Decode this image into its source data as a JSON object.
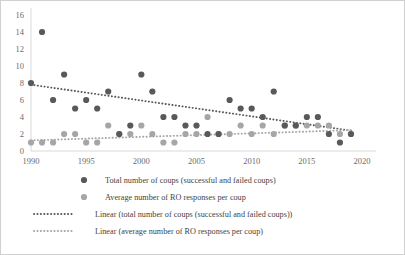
{
  "chart_data": {
    "type": "scatter",
    "title": "",
    "xlabel": "",
    "ylabel": "",
    "xlim": [
      1990,
      2020
    ],
    "ylim": [
      0,
      16
    ],
    "xticks": [
      "1990",
      "1995",
      "2000",
      "2005",
      "2010",
      "2015",
      "2020"
    ],
    "yticks": [
      "0",
      "2",
      "4",
      "6",
      "8",
      "10",
      "12",
      "14",
      "16"
    ],
    "grid": false,
    "legend_position": "bottom",
    "colors": {
      "total_coups": "#595959",
      "ro_responses": "#a6a6a6",
      "trend_total": "#595959",
      "trend_ro": "#a6a6a6",
      "axis": "#d9d9d9",
      "border": "#d0d0d0",
      "text": "#595959"
    },
    "series": [
      {
        "name": "Total number of coups (successful and failed coups)",
        "marker": "circle",
        "color": "#595959",
        "x": [
          1990,
          1991,
          1992,
          1993,
          1994,
          1995,
          1996,
          1997,
          1998,
          1999,
          2000,
          2001,
          2002,
          2003,
          2004,
          2005,
          2006,
          2007,
          2008,
          2009,
          2010,
          2011,
          2012,
          2013,
          2014,
          2015,
          2016,
          2017,
          2018,
          2019
        ],
        "y": [
          8,
          14,
          6,
          9,
          5,
          6,
          5,
          7,
          2,
          3,
          9,
          7,
          4,
          4,
          3,
          3,
          2,
          2,
          6,
          5,
          5,
          4,
          7,
          3,
          3,
          4,
          4,
          2,
          1,
          2
        ]
      },
      {
        "name": "Average number of RO responses per coup",
        "marker": "circle",
        "color": "#a6a6a6",
        "x": [
          1990,
          1991,
          1992,
          1993,
          1994,
          1995,
          1996,
          1997,
          1998,
          1999,
          2000,
          2001,
          2002,
          2003,
          2004,
          2005,
          2006,
          2007,
          2008,
          2009,
          2010,
          2011,
          2012,
          2013,
          2014,
          2015,
          2016,
          2017,
          2018,
          2019
        ],
        "y": [
          1,
          1,
          1,
          2,
          2,
          1,
          1,
          3,
          2,
          2,
          3,
          2,
          1,
          1,
          2,
          2,
          4,
          2,
          2,
          3,
          2,
          3,
          2,
          3,
          3,
          3,
          3,
          3,
          2,
          2
        ]
      }
    ],
    "trendlines": [
      {
        "name": "Linear (total number of coups (successful and failed coups))",
        "color": "#595959",
        "style": "dotted",
        "x": [
          1990,
          2019
        ],
        "y": [
          7.8,
          2.4
        ]
      },
      {
        "name": "Linear (average number of RO responses per coup)",
        "color": "#a6a6a6",
        "style": "dotted",
        "x": [
          1990,
          2019
        ],
        "y": [
          1.25,
          2.45
        ]
      }
    ]
  },
  "legend": {
    "items": [
      {
        "label": "Total number of coups (successful and failed coups)",
        "symbol": "marker",
        "color": "#595959"
      },
      {
        "label": "Average number of RO responses per coup",
        "symbol": "marker",
        "color": "#a6a6a6"
      },
      {
        "label": "Linear (total number of coups (successful and failed coups))",
        "symbol": "dotted-line",
        "color": "#595959"
      },
      {
        "label": "Linear (average number of RO responses per coup)",
        "symbol": "dotted-line",
        "color": "#a6a6a6"
      }
    ]
  }
}
